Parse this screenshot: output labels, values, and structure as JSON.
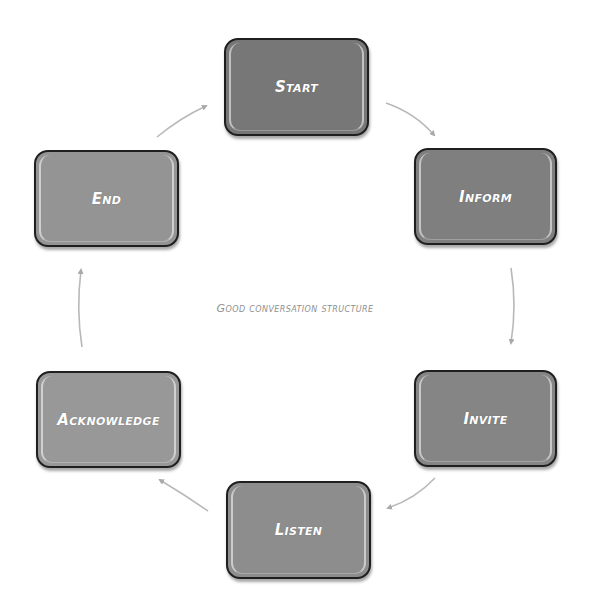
{
  "diagram": {
    "title": "Good conversation structure",
    "type": "cycle",
    "nodes": [
      {
        "id": "start",
        "label": "Start",
        "color": "#777777"
      },
      {
        "id": "inform",
        "label": "Inform",
        "color": "#7f7f7f"
      },
      {
        "id": "invite",
        "label": "Invite",
        "color": "#858585"
      },
      {
        "id": "listen",
        "label": "Listen",
        "color": "#8d8d8d"
      },
      {
        "id": "acknowledge",
        "label": "Acknowledge",
        "color": "#989898"
      },
      {
        "id": "end",
        "label": "End",
        "color": "#949494"
      }
    ],
    "edges": [
      {
        "from": "Start",
        "to": "Inform"
      },
      {
        "from": "Inform",
        "to": "Invite"
      },
      {
        "from": "Invite",
        "to": "Listen"
      },
      {
        "from": "Listen",
        "to": "Acknowledge"
      },
      {
        "from": "Acknowledge",
        "to": "End"
      },
      {
        "from": "End",
        "to": "Start"
      }
    ],
    "arrow_color": "#b5b5b5",
    "border_color": "#1f1f1f"
  }
}
